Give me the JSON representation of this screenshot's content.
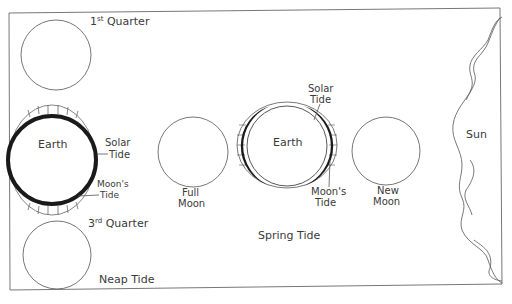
{
  "diagram": {
    "title_bottom_left": "Neap Tide",
    "title_center": "Spring Tide",
    "neap": {
      "first_quarter": {
        "base": "1",
        "sup": "st",
        "rest": " Quarter"
      },
      "third_quarter": {
        "base": "3",
        "sup": "rd",
        "rest": " Quarter"
      },
      "earth_label": "Earth",
      "solar_tide_line1": "Solar",
      "solar_tide_line2": "Tide",
      "moons_tide_line1": "Moon's",
      "moons_tide_line2": "Tide"
    },
    "spring": {
      "full_moon_line1": "Full",
      "full_moon_line2": "Moon",
      "earth_label": "Earth",
      "solar_tide_line1": "Solar",
      "solar_tide_line2": "Tide",
      "moons_tide_line1": "Moon's",
      "moons_tide_line2": "Tide",
      "new_moon_line1": "New",
      "new_moon_line2": "Moon"
    },
    "sun_label": "Sun",
    "colors": {
      "line": "#555555",
      "tide_fill": "#1a1a1a",
      "frame": "#777777"
    }
  }
}
